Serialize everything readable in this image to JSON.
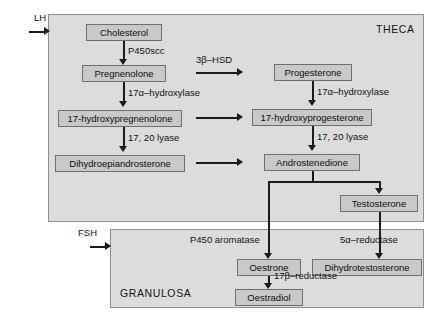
{
  "diagram": {
    "colors": {
      "panel_fill": "#dcdcdc",
      "panel_border": "#8e8e8e",
      "node_fill": "#c9c9c9",
      "node_border": "#6e6e6e",
      "connector": "#1b1b1b",
      "background": "#ffffff"
    }
  },
  "compartments": [
    {
      "id": "theca",
      "label": "THECA"
    },
    {
      "id": "granulosa",
      "label": "GRANULOSA"
    }
  ],
  "hormones": [
    {
      "id": "lh",
      "label": "LH",
      "target": "theca"
    },
    {
      "id": "fsh",
      "label": "FSH",
      "target": "granulosa"
    }
  ],
  "nodes": [
    {
      "id": "cholesterol",
      "label": "Cholesterol",
      "compartment": "theca"
    },
    {
      "id": "pregnenolone",
      "label": "Pregnenolone",
      "compartment": "theca"
    },
    {
      "id": "17-hydroxypregnenolone",
      "label": "17-hydroxypregnenolone",
      "compartment": "theca"
    },
    {
      "id": "dhea",
      "label": "Dihydroepiandrosterone",
      "compartment": "theca"
    },
    {
      "id": "progesterone",
      "label": "Progesterone",
      "compartment": "theca"
    },
    {
      "id": "17-hydroxyprogesterone",
      "label": "17-hydroxyprogesterone",
      "compartment": "theca"
    },
    {
      "id": "androstenedione",
      "label": "Androstenedione",
      "compartment": "theca"
    },
    {
      "id": "testosterone",
      "label": "Testosterone",
      "compartment": "theca"
    },
    {
      "id": "oestrone",
      "label": "Oestrone",
      "compartment": "granulosa"
    },
    {
      "id": "dht",
      "label": "Dihydrotestosterone",
      "compartment": "granulosa"
    },
    {
      "id": "oestradiol",
      "label": "Oestradiol",
      "compartment": "granulosa"
    }
  ],
  "enzymes": [
    {
      "id": "p450scc",
      "label": "P450scc",
      "from": "cholesterol",
      "to": "pregnenolone"
    },
    {
      "id": "17a-hydroxylase-left",
      "label": "17α–hydroxylase",
      "from": "pregnenolone",
      "to": "17-hydroxypregnenolone"
    },
    {
      "id": "17-20-lyase-left",
      "label": "17, 20 lyase",
      "from": "17-hydroxypregnenolone",
      "to": "dhea"
    },
    {
      "id": "3b-hsd",
      "label": "3β–HSD",
      "from": "pregnenolone",
      "to": "progesterone"
    },
    {
      "id": "17a-hydroxylase-right",
      "label": "17α–hydroxylase",
      "from": "progesterone",
      "to": "17-hydroxyprogesterone"
    },
    {
      "id": "17-20-lyase-right",
      "label": "17, 20 lyase",
      "from": "17-hydroxyprogesterone",
      "to": "androstenedione"
    },
    {
      "id": "p450-aromatase",
      "label": "P450 aromatase",
      "from": "androstenedione",
      "to": "oestrone"
    },
    {
      "id": "5a-reductase",
      "label": "5α–reductase",
      "from": "testosterone",
      "to": "dht"
    },
    {
      "id": "17b-reductase",
      "label": "17β–reductase",
      "from": "oestrone",
      "to": "oestradiol"
    }
  ]
}
